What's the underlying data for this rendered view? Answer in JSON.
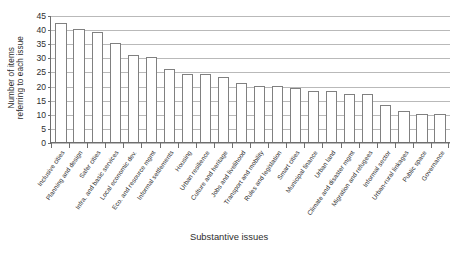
{
  "chart_data": {
    "type": "bar",
    "title": "",
    "xlabel": "Substantive issues",
    "ylabel": "Number of items referring to each issue",
    "ylabel_line1": "Number of items",
    "ylabel_line2": "referring to each issue",
    "ylim": [
      0,
      45
    ],
    "ytick_step": 5,
    "yticks": [
      0,
      5,
      10,
      15,
      20,
      25,
      30,
      35,
      40,
      45
    ],
    "grid": true,
    "legend": "none",
    "orientation": "vertical",
    "bar_face_color": "#ffffff",
    "bar_edge_color": "#808080",
    "categories": [
      "Inclusive cities",
      "Planning and design",
      "Safer cities",
      "Infra. and basic services",
      "Local economic dev.",
      "Eco. and resource mgmt",
      "Informal settlements",
      "Housing",
      "Urban resilience",
      "Culture and heritage",
      "Jobs and livelihood",
      "Transport and mobility",
      "Rules and legislation",
      "Smart cities",
      "Municipal finance",
      "Urban land",
      "Climate and disaster mgmt",
      "Migration and refugees",
      "Informal sector",
      "Urban-rural linkages",
      "Public space",
      "Governance"
    ],
    "values": [
      42,
      40,
      39,
      35,
      31,
      30,
      26,
      24,
      24,
      23,
      21,
      20,
      20,
      19,
      18,
      18,
      17,
      17,
      13,
      11,
      10,
      10
    ]
  },
  "axes": {
    "y_title": "Number of items referring to each issue",
    "x_title": "Substantive issues"
  }
}
